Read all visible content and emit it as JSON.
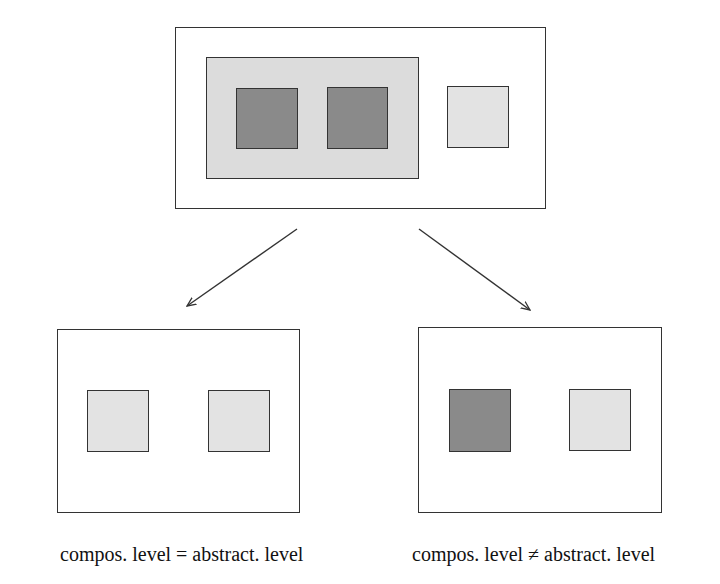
{
  "diagram": {
    "top": {
      "label": "original composition",
      "group_contains": [
        "dark",
        "dark"
      ],
      "separate": [
        "light"
      ]
    },
    "left": {
      "caption": "compos. level = abstract. level",
      "elements": [
        "light",
        "light"
      ]
    },
    "right": {
      "caption": "compos. level ≠ abstract. level",
      "elements": [
        "dark",
        "light"
      ]
    },
    "colors": {
      "border": "#333333",
      "group_fill": "#dcdcdc",
      "dark_fill": "#8a8a8a",
      "light_fill": "#e3e3e3"
    }
  }
}
